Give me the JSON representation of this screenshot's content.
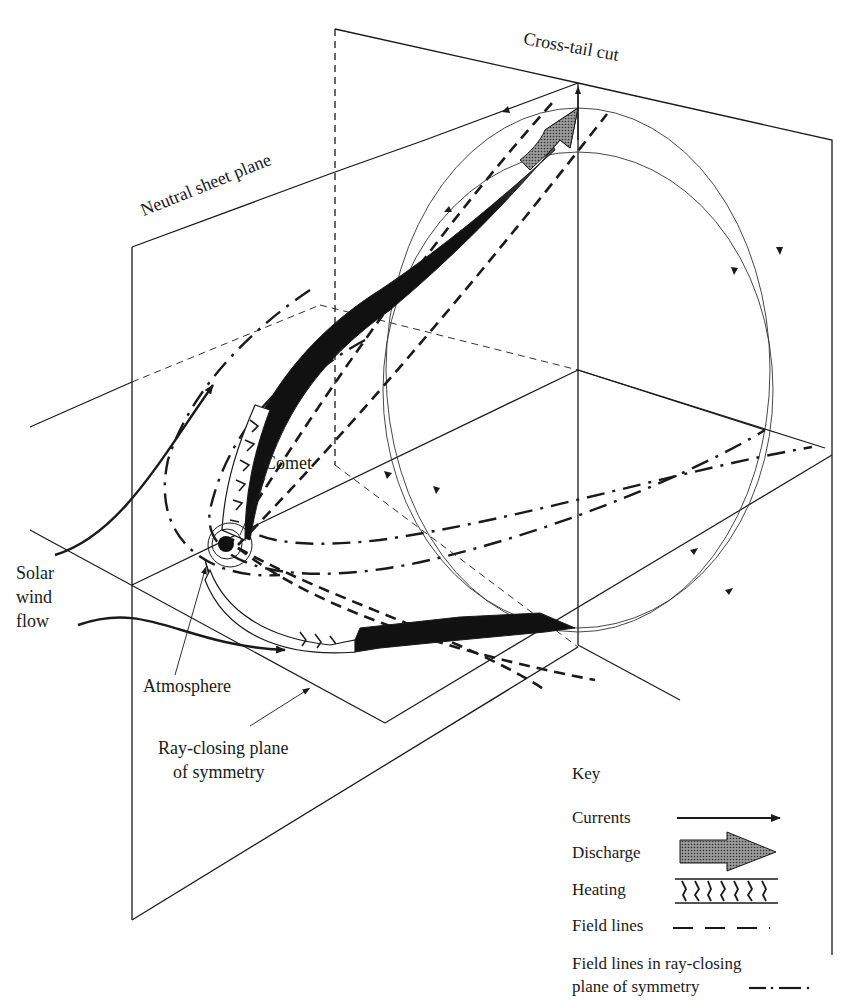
{
  "diagram": {
    "type": "3D schematic of comet plasma tail current system",
    "labels": {
      "cross_tail_cut": "Cross-tail cut",
      "neutral_sheet_plane": "Neutral sheet plane",
      "comet": "Comet",
      "solar_wind_line1": "Solar",
      "solar_wind_line2": "wind",
      "solar_wind_line3": "flow",
      "atmosphere": "Atmosphere",
      "ray_closing_line1": "Ray-closing plane",
      "ray_closing_line2": "of symmetry"
    },
    "key": {
      "title": "Key",
      "items": [
        {
          "label": "Currents",
          "symbol": "solid-arrow"
        },
        {
          "label": "Discharge",
          "symbol": "shaded-block-arrow"
        },
        {
          "label": "Heating",
          "symbol": "hatched-band"
        },
        {
          "label": "Field lines",
          "symbol": "dashed-line"
        },
        {
          "label_line1": "Field lines in ray-closing",
          "label_line2": "plane of symmetry",
          "symbol": "dash-dot-line"
        }
      ]
    },
    "colors": {
      "ink": "#1a1a1a",
      "background": "#ffffff",
      "discharge_shade": "#777777"
    }
  }
}
